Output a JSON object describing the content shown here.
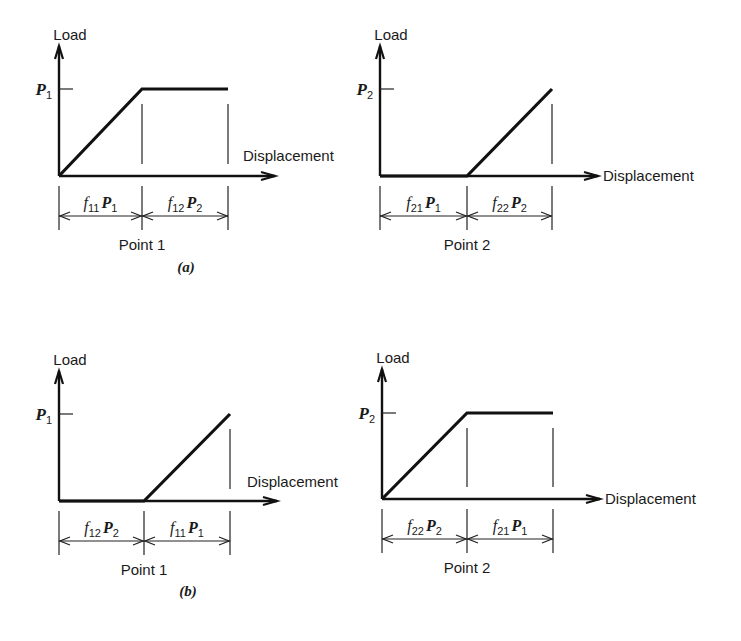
{
  "figure": {
    "panels": [
      {
        "id": "a",
        "caption": "(a)",
        "plots": [
          {
            "point_label": "Point 1",
            "y_axis_label": "Load",
            "x_axis_label": "Displacement",
            "load_symbol": "P",
            "load_subscript": "1",
            "shape": "ramp-then-plateau",
            "segments": [
              {
                "flex": "f",
                "flex_sub": "11",
                "load": "P",
                "load_sub": "1"
              },
              {
                "flex": "f",
                "flex_sub": "12",
                "load": "P",
                "load_sub": "2"
              }
            ]
          },
          {
            "point_label": "Point 2",
            "y_axis_label": "Load",
            "x_axis_label": "Displacement",
            "load_symbol": "P",
            "load_subscript": "2",
            "shape": "zero-then-ramp",
            "segments": [
              {
                "flex": "f",
                "flex_sub": "21",
                "load": "P",
                "load_sub": "1"
              },
              {
                "flex": "f",
                "flex_sub": "22",
                "load": "P",
                "load_sub": "2"
              }
            ]
          }
        ]
      },
      {
        "id": "b",
        "caption": "(b)",
        "plots": [
          {
            "point_label": "Point 1",
            "y_axis_label": "Load",
            "x_axis_label": "Displacement",
            "load_symbol": "P",
            "load_subscript": "1",
            "shape": "zero-then-ramp",
            "segments": [
              {
                "flex": "f",
                "flex_sub": "12",
                "load": "P",
                "load_sub": "2"
              },
              {
                "flex": "f",
                "flex_sub": "11",
                "load": "P",
                "load_sub": "1"
              }
            ]
          },
          {
            "point_label": "Point 2",
            "y_axis_label": "Load",
            "x_axis_label": "Displacement",
            "load_symbol": "P",
            "load_subscript": "2",
            "shape": "ramp-then-plateau",
            "segments": [
              {
                "flex": "f",
                "flex_sub": "22",
                "load": "P",
                "load_sub": "2"
              },
              {
                "flex": "f",
                "flex_sub": "21",
                "load": "P",
                "load_sub": "1"
              }
            ]
          }
        ]
      }
    ]
  }
}
